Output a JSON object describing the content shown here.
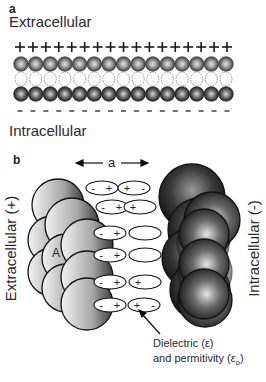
{
  "panel_a": {
    "label": "a",
    "top_label": "Extracellular",
    "bottom_label": "Intracellular",
    "plus_count": 17,
    "minus_count": 17,
    "sphere_count": 15,
    "plus_symbol": "+",
    "minus_symbol": "-"
  },
  "panel_b": {
    "label": "b",
    "distance_label": "a",
    "left_label": "Extracellular (+)",
    "right_label": "Intracellular (-)",
    "sphere_label": "A",
    "caption_line1": "Dielectric (ε)",
    "caption_line2_prefix": "and permitivity (",
    "caption_line2_symbol": "ε",
    "caption_line2_sub": "o",
    "caption_line2_suffix": ")",
    "dipoles": [
      {
        "row": 1,
        "left": [
          "-",
          "+"
        ],
        "right": [
          "+",
          "-"
        ]
      },
      {
        "row": 2,
        "left": [
          "-",
          "+"
        ],
        "right": [
          "+",
          ""
        ]
      },
      {
        "row": 3,
        "left": [
          "-",
          "+"
        ],
        "right": [
          "",
          ""
        ]
      },
      {
        "row": 4,
        "left": [
          "-",
          "+"
        ],
        "right": [
          "",
          ""
        ]
      },
      {
        "row": 5,
        "left": [
          "-",
          "+"
        ],
        "right": [
          "+",
          ""
        ]
      },
      {
        "row": 6,
        "left": [
          "-",
          "+"
        ],
        "right": [
          "+",
          "-"
        ]
      }
    ]
  },
  "colors": {
    "sphere_light": "#e8e8e8",
    "sphere_mid": "#8a8a8a",
    "sphere_dark": "#1e1e1e",
    "outline": "#111111",
    "text": "#2a2a2a"
  }
}
